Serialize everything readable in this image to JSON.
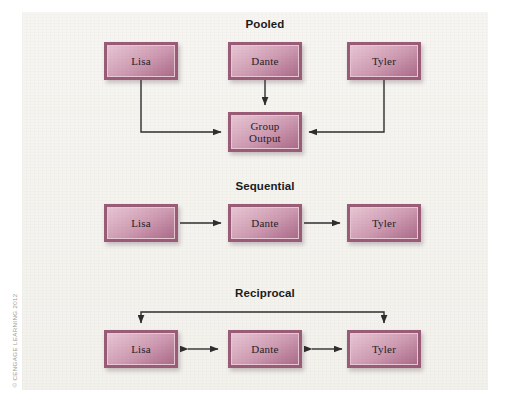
{
  "figure": {
    "credit": "© CENGAGE LEARNING 2012",
    "background_color": "#f4f3ef",
    "page_color": "#ffffff",
    "node_frame_color": "#9a5c76",
    "node_fill_light": "#e8c5d3",
    "node_fill_dark": "#ab6c8a",
    "connector_color": "#2e2e2e"
  },
  "sections": [
    {
      "title": "Pooled",
      "title_x": 243,
      "title_y": 6,
      "nodes": [
        {
          "label": "Lisa",
          "x": 82,
          "y": 30,
          "w": 74,
          "h": 38
        },
        {
          "label": "Dante",
          "x": 206,
          "y": 30,
          "w": 74,
          "h": 38
        },
        {
          "label": "Tyler",
          "x": 325,
          "y": 30,
          "w": 74,
          "h": 38
        },
        {
          "label": "Group\nOutput",
          "x": 206,
          "y": 100,
          "w": 74,
          "h": 40
        }
      ]
    },
    {
      "title": "Sequential",
      "title_x": 243,
      "title_y": 168,
      "nodes": [
        {
          "label": "Lisa",
          "x": 82,
          "y": 192,
          "w": 74,
          "h": 38
        },
        {
          "label": "Dante",
          "x": 206,
          "y": 192,
          "w": 74,
          "h": 38
        },
        {
          "label": "Tyler",
          "x": 325,
          "y": 192,
          "w": 74,
          "h": 38
        }
      ]
    },
    {
      "title": "Reciprocal",
      "title_x": 243,
      "title_y": 275,
      "nodes": [
        {
          "label": "Lisa",
          "x": 82,
          "y": 318,
          "w": 74,
          "h": 38
        },
        {
          "label": "Dante",
          "x": 206,
          "y": 318,
          "w": 74,
          "h": 38
        },
        {
          "label": "Tyler",
          "x": 325,
          "y": 318,
          "w": 74,
          "h": 38
        }
      ]
    }
  ],
  "connectors": [
    {
      "name": "pooled-lisa-to-group",
      "type": "elbow-right",
      "arrow": "end"
    },
    {
      "name": "pooled-dante-to-group",
      "type": "straight-down",
      "arrow": "end"
    },
    {
      "name": "pooled-tyler-to-group",
      "type": "elbow-left",
      "arrow": "end"
    },
    {
      "name": "sequential-lisa-to-dante",
      "type": "straight-right",
      "arrow": "end"
    },
    {
      "name": "sequential-dante-to-tyler",
      "type": "straight-right",
      "arrow": "end"
    },
    {
      "name": "reciprocal-top-bracket",
      "type": "bracket-down",
      "arrow": "both-ends-down"
    },
    {
      "name": "reciprocal-lisa-dante",
      "type": "straight-horizontal",
      "arrow": "both"
    },
    {
      "name": "reciprocal-dante-tyler",
      "type": "straight-horizontal",
      "arrow": "both"
    }
  ]
}
